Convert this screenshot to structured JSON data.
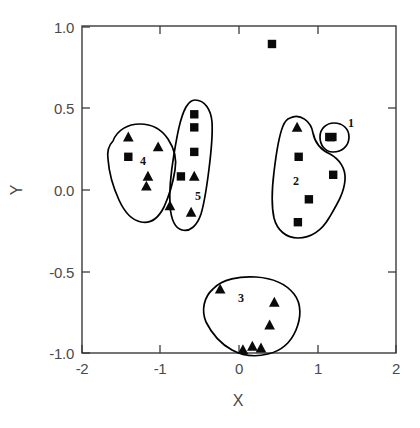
{
  "chart_data": {
    "type": "scatter",
    "title": "",
    "xlabel": "X",
    "ylabel": "Y",
    "xlim": [
      -2,
      2
    ],
    "ylim": [
      -1.0,
      1.0
    ],
    "xticks": [
      -2,
      -1,
      0,
      1,
      2
    ],
    "xticklabels": [
      "-2",
      "-1",
      "0",
      "1",
      "2"
    ],
    "yticks": [
      -1.0,
      -0.5,
      0.0,
      0.5,
      1.0
    ],
    "yticklabels": [
      "-1.0",
      "-0.5",
      "0.0",
      "0.5",
      "1.0"
    ],
    "grid": false,
    "legend": "none",
    "marker_types": [
      "square",
      "triangle"
    ],
    "series": [
      {
        "name": "square",
        "marker": "square",
        "points": [
          {
            "x": 0.42,
            "y": 0.89
          },
          {
            "x": -1.41,
            "y": 0.2
          },
          {
            "x": -0.57,
            "y": 0.46
          },
          {
            "x": -0.57,
            "y": 0.38
          },
          {
            "x": -0.57,
            "y": 0.23
          },
          {
            "x": -0.74,
            "y": 0.08
          },
          {
            "x": 0.76,
            "y": 0.2
          },
          {
            "x": 1.2,
            "y": 0.09
          },
          {
            "x": 0.89,
            "y": -0.06
          },
          {
            "x": 0.75,
            "y": -0.2
          },
          {
            "x": 1.17,
            "y": 0.32
          }
        ]
      },
      {
        "name": "triangle",
        "marker": "triangle",
        "points": [
          {
            "x": -1.41,
            "y": 0.32
          },
          {
            "x": -1.03,
            "y": 0.26
          },
          {
            "x": -1.16,
            "y": 0.08
          },
          {
            "x": -1.18,
            "y": 0.02
          },
          {
            "x": -0.88,
            "y": -0.1
          },
          {
            "x": -0.57,
            "y": 0.08
          },
          {
            "x": -0.61,
            "y": -0.14
          },
          {
            "x": 0.74,
            "y": 0.38
          },
          {
            "x": -0.24,
            "y": -0.61
          },
          {
            "x": 0.45,
            "y": -0.69
          },
          {
            "x": 0.39,
            "y": -0.83
          },
          {
            "x": 0.05,
            "y": -0.98
          },
          {
            "x": 0.17,
            "y": -0.96
          },
          {
            "x": 0.28,
            "y": -0.97
          }
        ]
      }
    ],
    "clusters": [
      {
        "label": "1",
        "label_x": 1.38,
        "label_y": 0.4,
        "member_count": 1
      },
      {
        "label": "2",
        "label_x": 0.73,
        "label_y": 0.04,
        "member_count": 5
      },
      {
        "label": "3",
        "label_x": 0.02,
        "label_y": -0.68,
        "member_count": 6
      },
      {
        "label": "4",
        "label_x": -1.22,
        "label_y": 0.13,
        "member_count": 6
      },
      {
        "label": "5",
        "label_x": -0.52,
        "label_y": -0.12,
        "member_count": 6
      }
    ],
    "unclustered_points": [
      {
        "x": 0.42,
        "y": 0.89,
        "marker": "square"
      }
    ]
  },
  "colors": {
    "marker": "#0a0a0a",
    "hull": "#000000",
    "axis": "#3b3b3b",
    "tick_label": "#4a4a4a",
    "background": "#ffffff"
  }
}
